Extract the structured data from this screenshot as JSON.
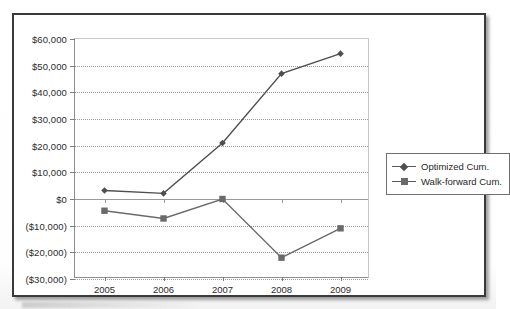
{
  "chart_data": {
    "type": "line",
    "title": "",
    "xlabel": "",
    "ylabel": "",
    "categories": [
      "2005",
      "2006",
      "2007",
      "2008",
      "2009"
    ],
    "ylim": [
      -30000,
      60000
    ],
    "ytick_step": 10000,
    "ytick_labels": [
      "$60,000",
      "$50,000",
      "$40,000",
      "$30,000",
      "$20,000",
      "$10,000",
      "$0",
      "($10,000)",
      "($20,000)",
      "($30,000)"
    ],
    "ytick_values": [
      60000,
      50000,
      40000,
      30000,
      20000,
      10000,
      0,
      -10000,
      -20000,
      -30000
    ],
    "grid": true,
    "legend_position": "right-outside",
    "series": [
      {
        "name": "Optimized Cum.",
        "marker": "diamond",
        "color": "#4f4f4f",
        "values": [
          3200,
          2100,
          21000,
          47000,
          54500
        ]
      },
      {
        "name": "Walk-forward Cum.",
        "marker": "square",
        "color": "#6a6a6a",
        "values": [
          -4400,
          -7300,
          0,
          -22000,
          -11000
        ]
      }
    ]
  },
  "legend": {
    "items": [
      {
        "label": "Optimized Cum."
      },
      {
        "label": "Walk-forward Cum."
      }
    ]
  }
}
